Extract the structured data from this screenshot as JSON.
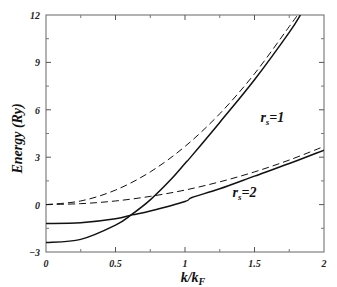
{
  "chart_data": {
    "type": "line",
    "title": "",
    "xlabel": "k/k_F",
    "ylabel": "Energy (Ry)",
    "xlim": [
      0,
      2
    ],
    "ylim": [
      -3,
      12
    ],
    "grid": false,
    "legend": "none",
    "x_ticks": [
      "0",
      "0.5",
      "1",
      "1.5",
      "2"
    ],
    "y_ticks": [
      "-3",
      "0",
      "3",
      "6",
      "9",
      "12"
    ],
    "annotations": [
      {
        "text": "r_s=1",
        "x": 1.6,
        "y": 5.2
      },
      {
        "text": "r_s=2",
        "x": 1.4,
        "y": 0.5
      }
    ],
    "series": [
      {
        "name": "r_s=1 free electron (dashed)",
        "style": "dashed",
        "x": [
          0,
          0.25,
          0.5,
          0.75,
          1.0,
          1.25,
          1.5,
          1.75,
          1.81
        ],
        "y": [
          0,
          0.23,
          0.92,
          2.07,
          3.68,
          5.75,
          8.28,
          11.27,
          12.0
        ]
      },
      {
        "name": "r_s=1 interacting (solid)",
        "style": "solid",
        "x": [
          0,
          0.25,
          0.5,
          0.62,
          0.75,
          0.9,
          1.0,
          1.05,
          1.25,
          1.5,
          1.75,
          1.83
        ],
        "y": [
          -2.4,
          -2.2,
          -1.3,
          -0.6,
          0.3,
          1.6,
          2.6,
          3.1,
          5.2,
          7.9,
          10.9,
          12.0
        ]
      },
      {
        "name": "r_s=2 free electron (dashed)",
        "style": "dashed",
        "x": [
          0,
          0.25,
          0.5,
          0.75,
          1.0,
          1.25,
          1.5,
          1.75,
          2.0
        ],
        "y": [
          0,
          0.06,
          0.23,
          0.52,
          0.92,
          1.44,
          2.07,
          2.82,
          3.68
        ]
      },
      {
        "name": "r_s=2 interacting (solid)",
        "style": "solid",
        "x": [
          0,
          0.25,
          0.5,
          0.62,
          0.75,
          1.0,
          1.05,
          1.25,
          1.5,
          1.75,
          2.0
        ],
        "y": [
          -1.2,
          -1.15,
          -0.9,
          -0.65,
          -0.4,
          0.2,
          0.45,
          1.0,
          1.8,
          2.6,
          3.45
        ]
      }
    ]
  }
}
